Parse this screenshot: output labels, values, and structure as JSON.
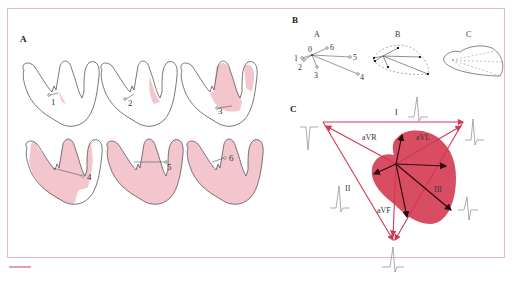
{
  "figure": {
    "panels": {
      "A": {
        "label": "A",
        "stages": [
          {
            "number": "1",
            "description": "septum activation begins (minimal shading)"
          },
          {
            "number": "2",
            "description": "septal depolarization spreading"
          },
          {
            "number": "3",
            "description": "septum and apex depolarized"
          },
          {
            "number": "4",
            "description": "most of ventricles depolarized"
          },
          {
            "number": "5",
            "description": "nearly full ventricular depolarization"
          },
          {
            "number": "6",
            "description": "complete ventricular depolarization"
          }
        ]
      },
      "B": {
        "label": "B",
        "subpanels": [
          {
            "label": "A",
            "points": [
              "0",
              "1",
              "2",
              "3",
              "4",
              "5",
              "6"
            ]
          },
          {
            "label": "B"
          },
          {
            "label": "C"
          }
        ]
      },
      "C": {
        "label": "C",
        "leads": {
          "I": "I",
          "II": "II",
          "III": "III",
          "aVR": "aVR",
          "aVL": "aVL",
          "aVF": "aVF"
        }
      }
    },
    "colors": {
      "frame": "#e7b9c3",
      "shading": "#f3c5cd",
      "loop": "#d94d63",
      "axis_lines": "#d2384f",
      "vectors": "#2a0a0f",
      "outline": "#555555"
    }
  }
}
